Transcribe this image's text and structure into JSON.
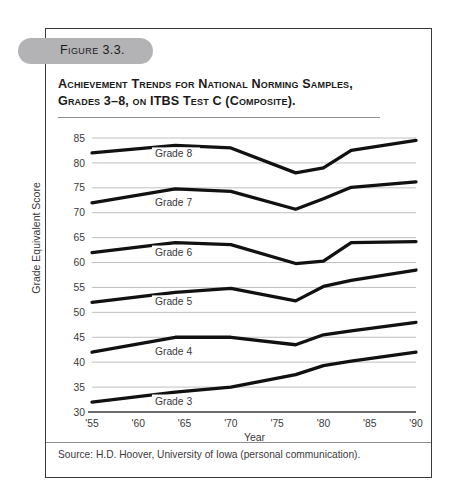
{
  "figure": {
    "number_label": "Figure 3.3.",
    "title": "Achievement Trends for National Norming Samples, Grades 3–8, on ITBS Test C (Composite).",
    "source": "Source: H.D. Hoover, University of Iowa (personal communication)."
  },
  "chart_data": {
    "type": "line",
    "title": "Achievement Trends for National Norming Samples, Grades 3–8, on ITBS Test C (Composite).",
    "xlabel": "Year",
    "ylabel": "Grade Equivalent Score",
    "xlim": [
      1955,
      1990
    ],
    "ylim": [
      30,
      85
    ],
    "grid": true,
    "legend": "inline-labels",
    "xticklabels": [
      "'55",
      "'60",
      "'65",
      "'70",
      "'75",
      "'80",
      "'85",
      "'90"
    ],
    "xtickvalues": [
      1955,
      1960,
      1965,
      1970,
      1975,
      1980,
      1985,
      1990
    ],
    "yticklabels": [
      "30",
      "35",
      "40",
      "45",
      "50",
      "55",
      "60",
      "65",
      "70",
      "75",
      "80",
      "85"
    ],
    "ytickvalues": [
      30,
      35,
      40,
      45,
      50,
      55,
      60,
      65,
      70,
      75,
      80,
      85
    ],
    "series": [
      {
        "name": "Grade 8",
        "label": "Grade 8",
        "x": [
          1955,
          1964,
          1970,
          1977,
          1980,
          1983,
          1990
        ],
        "values": [
          82.0,
          83.5,
          83.0,
          78.0,
          79.0,
          82.5,
          84.5
        ]
      },
      {
        "name": "Grade 7",
        "label": "Grade 7",
        "x": [
          1955,
          1964,
          1970,
          1977,
          1980,
          1983,
          1990
        ],
        "values": [
          72.0,
          74.8,
          74.3,
          70.7,
          72.8,
          75.1,
          76.2
        ]
      },
      {
        "name": "Grade 6",
        "label": "Grade 6",
        "x": [
          1955,
          1964,
          1970,
          1977,
          1980,
          1983,
          1990
        ],
        "values": [
          62.0,
          64.0,
          63.6,
          59.8,
          60.3,
          64.0,
          64.2
        ]
      },
      {
        "name": "Grade 5",
        "label": "Grade 5",
        "x": [
          1955,
          1964,
          1970,
          1977,
          1980,
          1983,
          1990
        ],
        "values": [
          52.0,
          54.0,
          54.8,
          52.3,
          55.2,
          56.4,
          58.5
        ]
      },
      {
        "name": "Grade 4",
        "label": "Grade 4",
        "x": [
          1955,
          1964,
          1970,
          1977,
          1980,
          1983,
          1990
        ],
        "values": [
          42.0,
          45.0,
          45.0,
          43.5,
          45.5,
          46.3,
          48.0
        ]
      },
      {
        "name": "Grade 3",
        "label": "Grade 3",
        "x": [
          1955,
          1964,
          1970,
          1977,
          1980,
          1983,
          1990
        ],
        "values": [
          32.0,
          34.0,
          35.0,
          37.5,
          39.3,
          40.2,
          42.0
        ]
      }
    ],
    "series_label_positions": [
      {
        "name": "Grade 8",
        "x": 1961.8,
        "y": 81.1
      },
      {
        "name": "Grade 7",
        "x": 1961.8,
        "y": 71.3
      },
      {
        "name": "Grade 6",
        "x": 1961.8,
        "y": 61.4
      },
      {
        "name": "Grade 5",
        "x": 1961.8,
        "y": 51.4
      },
      {
        "name": "Grade 4",
        "x": 1961.8,
        "y": 41.4
      },
      {
        "name": "Grade 3",
        "x": 1961.8,
        "y": 31.5
      }
    ],
    "colors": {
      "line": "#111111",
      "grid": "#b9b9bb",
      "axis": "#3a3a3c",
      "text": "#3a3a3c",
      "pill": "#b3b3b5"
    }
  }
}
